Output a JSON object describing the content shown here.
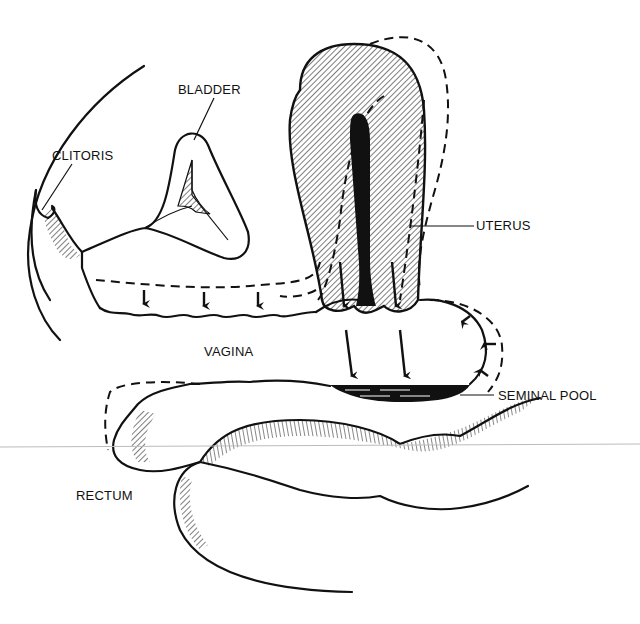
{
  "diagram": {
    "labels": {
      "bladder": "BLADDER",
      "clitoris": "CLITORIS",
      "uterus": "UTERUS",
      "vagina": "VAGINA",
      "seminal_pool": "SEMINAL POOL",
      "rectum": "RECTUM"
    },
    "colors": {
      "ink": "#111111",
      "background": "#ffffff"
    }
  }
}
